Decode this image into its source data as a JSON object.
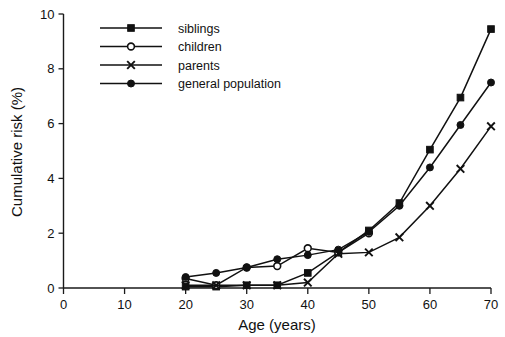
{
  "chart_data": {
    "type": "line",
    "title": "",
    "subtitle": "",
    "xlabel": "Age (years)",
    "ylabel": "Cumulative risk (%)",
    "xlim": [
      0,
      70
    ],
    "ylim": [
      0,
      10
    ],
    "xticks": [
      0,
      10,
      20,
      30,
      40,
      50,
      60,
      70
    ],
    "yticks": [
      0,
      2,
      4,
      6,
      8,
      10
    ],
    "xtick_labels": [
      "0",
      "10",
      "20",
      "30",
      "40",
      "50",
      "60",
      "70"
    ],
    "ytick_labels": [
      "0",
      "2",
      "4",
      "6",
      "8",
      "10"
    ],
    "grid": false,
    "legend_position": "top-left",
    "x": [
      20,
      25,
      30,
      35,
      40,
      45,
      50,
      55,
      60,
      65,
      70
    ],
    "series": [
      {
        "name": "siblings",
        "marker": "filled-square",
        "values": [
          0.05,
          0.05,
          0.1,
          0.1,
          0.55,
          1.3,
          2.1,
          3.1,
          5.05,
          6.95,
          9.45
        ]
      },
      {
        "name": "children",
        "marker": "open-circle",
        "values": [
          0.35,
          0.1,
          0.75,
          0.8,
          1.45,
          1.3,
          2.0,
          null,
          null,
          null,
          null
        ]
      },
      {
        "name": "parents",
        "marker": "cross",
        "values": [
          0.1,
          0.1,
          0.1,
          0.1,
          0.2,
          1.25,
          1.3,
          1.85,
          3.0,
          4.35,
          5.9
        ]
      },
      {
        "name": "general population",
        "marker": "filled-circle",
        "values": [
          0.4,
          0.55,
          0.75,
          1.05,
          1.2,
          1.4,
          2.05,
          3.0,
          4.4,
          5.95,
          7.5
        ]
      }
    ]
  },
  "legend": {
    "entries": [
      {
        "label": "siblings",
        "marker": "filled-square"
      },
      {
        "label": "children",
        "marker": "open-circle"
      },
      {
        "label": "parents",
        "marker": "cross"
      },
      {
        "label": "general population",
        "marker": "filled-circle"
      }
    ]
  },
  "axes": {
    "x_title": "Age (years)",
    "y_title": "Cumulative risk (%)"
  }
}
